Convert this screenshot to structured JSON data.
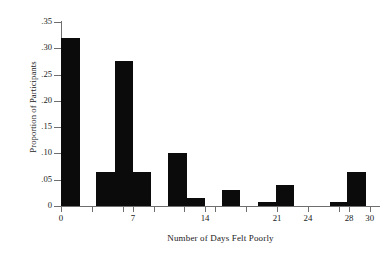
{
  "chart_data": {
    "type": "bar",
    "title": "",
    "xlabel": "Number of Days Felt Poorly",
    "ylabel": "Proportion of Participants",
    "xlim": [
      0,
      31
    ],
    "ylim": [
      0,
      0.35
    ],
    "grid": false,
    "legend": null,
    "bar_color": "#0b0b0b",
    "axis_color": "#6e6e6e",
    "y_ticks": [
      {
        "value": 0,
        "label": "0"
      },
      {
        "value": 0.05,
        "label": ".05"
      },
      {
        "value": 0.1,
        "label": ".10"
      },
      {
        "value": 0.15,
        "label": ".15"
      },
      {
        "value": 0.2,
        "label": ".20"
      },
      {
        "value": 0.25,
        "label": ".25"
      },
      {
        "value": 0.3,
        "label": ".30"
      },
      {
        "value": 0.35,
        "label": ".35"
      }
    ],
    "x_ticks": [
      {
        "value": 0,
        "label": "0"
      },
      {
        "value": 3,
        "label": ""
      },
      {
        "value": 6,
        "label": ""
      },
      {
        "value": 7,
        "label": "7"
      },
      {
        "value": 9,
        "label": ""
      },
      {
        "value": 12,
        "label": ""
      },
      {
        "value": 14,
        "label": "14"
      },
      {
        "value": 15,
        "label": ""
      },
      {
        "value": 18,
        "label": ""
      },
      {
        "value": 21,
        "label": "21"
      },
      {
        "value": 24,
        "label": "24"
      },
      {
        "value": 27,
        "label": ""
      },
      {
        "value": 28,
        "label": "28"
      },
      {
        "value": 30,
        "label": "30"
      }
    ],
    "bins": [
      {
        "x_start": 0,
        "x_end": 1.8,
        "value": 0.32
      },
      {
        "x_start": 3.4,
        "x_end": 5.2,
        "value": 0.065
      },
      {
        "x_start": 5.2,
        "x_end": 7.0,
        "value": 0.275
      },
      {
        "x_start": 7.0,
        "x_end": 8.7,
        "value": 0.065
      },
      {
        "x_start": 10.4,
        "x_end": 12.2,
        "value": 0.1
      },
      {
        "x_start": 12.2,
        "x_end": 14.0,
        "value": 0.015
      },
      {
        "x_start": 15.6,
        "x_end": 17.4,
        "value": 0.03
      },
      {
        "x_start": 19.1,
        "x_end": 20.9,
        "value": 0.008
      },
      {
        "x_start": 20.9,
        "x_end": 22.6,
        "value": 0.04
      },
      {
        "x_start": 26.1,
        "x_end": 27.8,
        "value": 0.008
      },
      {
        "x_start": 27.8,
        "x_end": 29.6,
        "value": 0.065
      }
    ],
    "categories": [
      "0",
      "7",
      "14",
      "21",
      "24",
      "28",
      "30"
    ],
    "values": [
      0.32,
      0.275,
      0.1,
      0.03,
      0.04,
      0.008,
      0.065
    ]
  }
}
